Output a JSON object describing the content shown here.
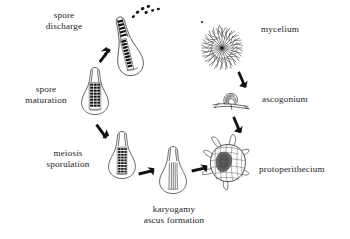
{
  "figure": {
    "kind": "fungal-sexual-life-cycle",
    "background": "#ffffff",
    "ink": "#1a1a1a",
    "fill_dark": "#111111",
    "fill_gray": "#6f6f6f",
    "fill_light": "#ffffff"
  },
  "labels": {
    "spore_discharge_line1": "spore",
    "spore_discharge_line2": "discharge",
    "spore_maturation_line1": "spore",
    "spore_maturation_line2": "maturation",
    "meiosis_line1": "meiosis",
    "meiosis_line2": "sporulation",
    "karyogamy_line1": "karyogamy",
    "karyogamy_line2": "ascus formation",
    "protoperithecium": "protoperithecium",
    "ascogonium": "ascogonium",
    "mycelium": "mycelium"
  },
  "stages": [
    {
      "id": "mycelium",
      "label": "mycelium",
      "order": 1,
      "icon": "radial-branching-hyphae",
      "center": [
        222,
        48
      ],
      "label_anchor": [
        262,
        27
      ]
    },
    {
      "id": "ascogonium",
      "label": "ascogonium",
      "order": 2,
      "icon": "coiled-ascogonium-on-hypha",
      "center": [
        232,
        101
      ],
      "label_anchor": [
        262,
        97
      ]
    },
    {
      "id": "protoperithecium",
      "label": "protoperithecium",
      "order": 3,
      "icon": "netted-protoperithecium-with-hyphae",
      "center": [
        228,
        163
      ],
      "label_anchor": [
        262,
        167
      ]
    },
    {
      "id": "karyogamy",
      "label": "karyogamy ascus formation",
      "order": 4,
      "icon": "perithecium-outline-asci",
      "center": [
        173,
        183
      ],
      "label_anchor": [
        174,
        203
      ]
    },
    {
      "id": "meiosis",
      "label": "meiosis sporulation",
      "order": 5,
      "icon": "perithecium-with-spore-ladder",
      "center": [
        122,
        168
      ],
      "label_anchor": [
        88,
        153
      ]
    },
    {
      "id": "spore-maturation",
      "label": "spore maturation",
      "order": 6,
      "icon": "perithecium-dark-spore-grid",
      "center": [
        95,
        104
      ],
      "label_anchor": [
        57,
        90
      ]
    },
    {
      "id": "spore-discharge",
      "label": "spore discharge",
      "order": 7,
      "icon": "perithecium-ejecting-spores",
      "center": [
        128,
        45
      ],
      "label_anchor": [
        64,
        16
      ]
    }
  ],
  "arrows": [
    {
      "id": "mycelium-to-ascogonium",
      "from": "mycelium",
      "to": "ascogonium"
    },
    {
      "id": "ascogonium-to-protoperithecium",
      "from": "ascogonium",
      "to": "protoperithecium"
    },
    {
      "id": "protoperithecium-to-karyogamy",
      "from": "protoperithecium",
      "to": "karyogamy"
    },
    {
      "id": "karyogamy-to-meiosis",
      "from": "karyogamy",
      "to": "meiosis"
    },
    {
      "id": "meiosis-to-spore-maturation",
      "from": "meiosis",
      "to": "spore-maturation"
    },
    {
      "id": "spore-maturation-to-spore-discharge",
      "from": "spore-maturation",
      "to": "spore-discharge"
    }
  ]
}
